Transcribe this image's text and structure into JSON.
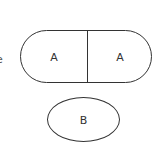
{
  "edge_fragment": "e",
  "stadium": {
    "left_label": "A",
    "right_label": "A"
  },
  "ellipse": {
    "label": "B"
  },
  "colors": {
    "stroke": "#333333",
    "background": "#ffffff"
  }
}
